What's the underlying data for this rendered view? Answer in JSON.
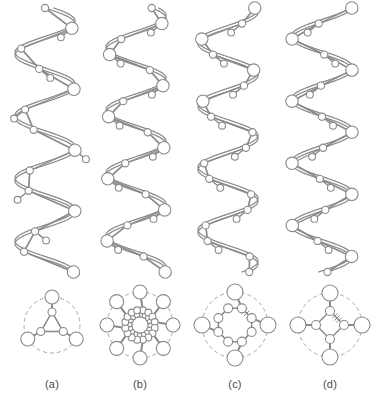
{
  "figure": {
    "type": "molecular-structure-diagram",
    "background_color": "#ffffff",
    "line_color": "#8a8a8a",
    "dashed_circle_color": "#a8a8a8",
    "node_fill": "#ffffff",
    "label_color": "#4a4a4a"
  },
  "panels": [
    {
      "id": "a",
      "label": "(a)",
      "label_x": 52,
      "helix": {
        "center_x": 45,
        "turns": 4.2,
        "amplitude": 30,
        "pitch_px": 62,
        "phase": 0.0,
        "residues_per_turn": 3,
        "backbone_strands": 2,
        "top_y": 8,
        "bottom_y": 272
      },
      "cross_section": {
        "center_x": 52,
        "center_y": 325,
        "outer_radius": 28,
        "inner_radius": 13,
        "fold": 3,
        "outer_node_r": 7,
        "inner_node_r": 4,
        "inner_ring_nodes": 3,
        "inner_double_ring": false,
        "hash_marks": 0,
        "start_angle": -90
      }
    },
    {
      "id": "b",
      "label": "(b)",
      "label_x": 140,
      "helix": {
        "center_x": 136,
        "turns": 4.2,
        "amplitude": 30,
        "pitch_px": 62,
        "phase": 0.55,
        "residues_per_turn": 4,
        "backbone_strands": 2,
        "top_y": 8,
        "bottom_y": 272
      },
      "cross_section": {
        "center_x": 140,
        "center_y": 325,
        "outer_radius": 33,
        "inner_radius": 15,
        "fold": 8,
        "outer_node_r": 7,
        "inner_node_r": 3.4,
        "inner_ring_nodes": 16,
        "inner_double_ring": true,
        "hash_marks": 0,
        "start_angle": -90
      }
    },
    {
      "id": "c",
      "label": "(c)",
      "label_x": 235,
      "helix": {
        "center_x": 228,
        "turns": 4.2,
        "amplitude": 30,
        "pitch_px": 62,
        "phase": 1.1,
        "residues_per_turn": 4,
        "backbone_strands": 2,
        "top_y": 8,
        "bottom_y": 272
      },
      "cross_section": {
        "center_x": 235,
        "center_y": 325,
        "outer_radius": 33,
        "inner_radius": 18,
        "fold": 4,
        "outer_node_r": 8,
        "inner_node_r": 4.5,
        "inner_ring_nodes": 8,
        "inner_double_ring": false,
        "hash_marks": 1,
        "start_angle": -90
      }
    },
    {
      "id": "d",
      "label": "(d)",
      "label_x": 330,
      "helix": {
        "center_x": 322,
        "turns": 4.2,
        "amplitude": 30,
        "pitch_px": 62,
        "phase": 1.7,
        "residues_per_turn": 4,
        "backbone_strands": 2,
        "top_y": 8,
        "bottom_y": 272
      },
      "cross_section": {
        "center_x": 330,
        "center_y": 325,
        "outer_radius": 32,
        "inner_radius": 14,
        "fold": 4,
        "outer_node_r": 8,
        "inner_node_r": 4.5,
        "inner_ring_nodes": 4,
        "inner_double_ring": false,
        "hash_marks": 1,
        "start_angle": -90
      }
    }
  ]
}
